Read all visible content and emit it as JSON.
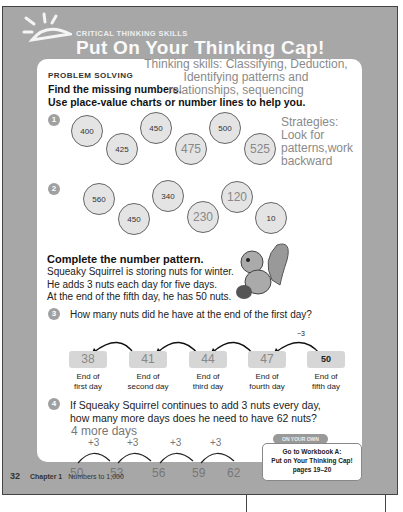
{
  "header": {
    "subtitle": "CRITICAL THINKING SKILLS",
    "title": "Put On Your Thinking Cap!"
  },
  "section": "PROBLEM SOLVING",
  "instructions": [
    "Find the missing numbers.",
    "Use place-value charts or number lines to help you."
  ],
  "annotations": {
    "skills": [
      "Thinking skills: Classifying, Deduction,",
      "Identifying patterns and",
      "relationships, sequencing"
    ],
    "strategies": [
      "Strategies:",
      "Look for",
      "patterns,work",
      "backward"
    ]
  },
  "q1": {
    "num": "1",
    "values": [
      "400",
      "425",
      "450",
      "475",
      "500",
      "525"
    ],
    "answers": [
      false,
      false,
      false,
      true,
      false,
      true
    ]
  },
  "q2": {
    "num": "2",
    "values": [
      "560",
      "450",
      "340",
      "230",
      "120",
      "10"
    ],
    "answers": [
      false,
      false,
      false,
      true,
      true,
      false
    ]
  },
  "pattern": {
    "heading": "Complete the number pattern.",
    "lines": [
      "Squeaky Squirrel is storing nuts for winter.",
      "He adds 3 nuts each day for five days.",
      "At the end of the fifth day, he has 50 nuts."
    ]
  },
  "q3": {
    "num": "3",
    "text": "How many nuts did he have at the end of the first day?",
    "arrow_label": "−3",
    "boxes": [
      {
        "value": "38",
        "l1": "End of",
        "l2": "first day"
      },
      {
        "value": "41",
        "l1": "End of",
        "l2": "second day"
      },
      {
        "value": "44",
        "l1": "End of",
        "l2": "third day"
      },
      {
        "value": "47",
        "l1": "End of",
        "l2": "fourth day"
      },
      {
        "value": "50",
        "l1": "End of",
        "l2": "fifth day"
      }
    ]
  },
  "q4": {
    "num": "4",
    "lines": [
      "If Squeaky Squirrel continues to add 3 nuts every day,",
      "how many more days does he need to have 62 nuts?"
    ],
    "answer": "4 more days",
    "steps": [
      "+3",
      "+3",
      "+3",
      "+3"
    ],
    "values": [
      "50",
      "53",
      "56",
      "59",
      "62"
    ]
  },
  "own": {
    "tag": "ON YOUR OWN",
    "lines": [
      "Go to Workbook A:",
      "Put on Your Thinking Cap!",
      "pages 19–20"
    ]
  },
  "footer": {
    "page": "32",
    "chapter": "Chapter 1",
    "topic": "Numbers to 1,000"
  }
}
